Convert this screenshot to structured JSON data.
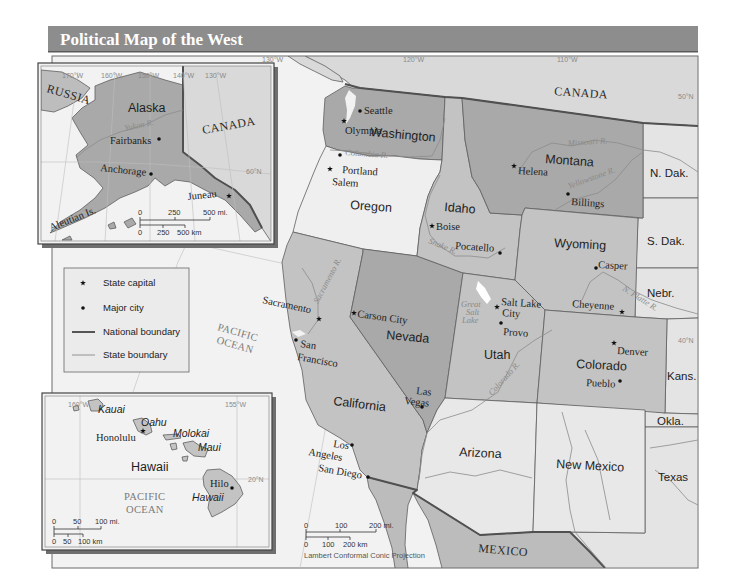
{
  "title": "Political Map of the West",
  "colors": {
    "title_bar": "#8d8d8d",
    "ocean": "#f2f2f2",
    "dark_state": "#a9a9a9",
    "medium_state": "#c3c3c3",
    "light_state": "#ececec",
    "other_state": "#e2e2e2",
    "foreign_land": "#d9d9d9"
  },
  "main_map": {
    "graticule": {
      "lon_130": "130°W",
      "lon_120": "120°W",
      "lon_110": "110°W",
      "lat_50": "50°N",
      "lat_40": "40°N"
    },
    "countries": {
      "canada": "CANADA",
      "mexico": "MEXICO"
    },
    "ocean": [
      "PACIFIC",
      "OCEAN"
    ],
    "states": {
      "washington": "Washington",
      "oregon": "Oregon",
      "california": "California",
      "nevada": "Nevada",
      "idaho": "Idaho",
      "montana": "Montana",
      "wyoming": "Wyoming",
      "utah": "Utah",
      "colorado": "Colorado",
      "arizona": "Arizona",
      "new_mexico": "New Mexico"
    },
    "neighbor_states": {
      "n_dak": "N. Dak.",
      "s_dak": "S. Dak.",
      "nebr": "Nebr.",
      "kans": "Kans.",
      "okla": "Okla.",
      "texas": "Texas"
    },
    "cities": {
      "seattle": {
        "name": "Seattle",
        "type": "major city"
      },
      "olympia": {
        "name": "Olympia",
        "type": "state capital"
      },
      "portland": {
        "name": "Portland",
        "type": "major city"
      },
      "salem": {
        "name": "Salem",
        "type": "state capital"
      },
      "boise": {
        "name": "Boise",
        "type": "state capital"
      },
      "pocatello": {
        "name": "Pocatello",
        "type": "major city"
      },
      "helena": {
        "name": "Helena",
        "type": "state capital"
      },
      "billings": {
        "name": "Billings",
        "type": "major city"
      },
      "casper": {
        "name": "Casper",
        "type": "major city"
      },
      "cheyenne": {
        "name": "Cheyenne",
        "type": "state capital"
      },
      "salt_lake_city": {
        "name_lines": [
          "Salt Lake",
          "City"
        ],
        "type": "state capital"
      },
      "provo": {
        "name": "Provo",
        "type": "major city"
      },
      "denver": {
        "name": "Denver",
        "type": "state capital"
      },
      "pueblo": {
        "name": "Pueblo",
        "type": "major city"
      },
      "sacramento": {
        "name": "Sacramento",
        "type": "state capital"
      },
      "san_francisco": {
        "name_lines": [
          "San",
          "Francisco"
        ],
        "type": "major city"
      },
      "carson_city": {
        "name": "Carson City",
        "type": "state capital"
      },
      "las_vegas": {
        "name_lines": [
          "Las",
          "Vegas"
        ],
        "type": "major city"
      },
      "los_angeles": {
        "name_lines": [
          "Los",
          "Angeles"
        ],
        "type": "major city"
      },
      "san_diego": {
        "name": "San Diego",
        "type": "major city"
      }
    },
    "rivers": {
      "columbia": "Columbia R.",
      "snake": "Snake R.",
      "missouri": "Missouri R.",
      "yellowstone": "Yellowstone R.",
      "n_platte": "N. Platte R.",
      "colorado": "Colorado R.",
      "sacramento": "Sacramento R."
    },
    "lakes": {
      "great_salt_lake": [
        "Great",
        "Salt",
        "Lake"
      ]
    },
    "scale": {
      "mi": [
        "0",
        "100",
        "200 mi."
      ],
      "km": [
        "0",
        "100",
        "200 km"
      ]
    },
    "projection": "Lambert Conformal Conic Projection"
  },
  "alaska_inset": {
    "state": "Alaska",
    "countries": {
      "russia": "RUSSIA",
      "canada": "CANADA"
    },
    "graticule": {
      "lon": [
        "170°W",
        "160°W",
        "150°W",
        "140°W",
        "130°W"
      ],
      "lat_60": "60°N"
    },
    "river": "Yukon R.",
    "islands": "Aleutian Is.",
    "cities": {
      "fairbanks": {
        "name": "Fairbanks",
        "type": "major city"
      },
      "anchorage": {
        "name": "Anchorage",
        "type": "major city"
      },
      "juneau": {
        "name": "Juneau",
        "type": "state capital"
      }
    },
    "scale": {
      "mi": [
        "0",
        "250",
        "500 mi."
      ],
      "km": [
        "0",
        "250",
        "500 km"
      ]
    }
  },
  "hawaii_inset": {
    "state": "Hawaii",
    "graticule": {
      "lon_160": "160°W",
      "lon_155": "155°W",
      "lat_20": "20°N"
    },
    "islands": {
      "kauai": "Kauai",
      "oahu": "Oahu",
      "molokai": "Molokai",
      "maui": "Maui",
      "hawaii": "Hawaii"
    },
    "cities": {
      "honolulu": {
        "name": "Honolulu",
        "type": "state capital"
      },
      "hilo": {
        "name": "Hilo",
        "type": "major city"
      }
    },
    "ocean": [
      "PACIFIC",
      "OCEAN"
    ],
    "scale": {
      "mi": [
        "0",
        "50",
        "100 mi."
      ],
      "km": [
        "0",
        "50",
        "100 km"
      ]
    }
  },
  "legend": {
    "items": [
      {
        "label": "State capital",
        "symbol": "star"
      },
      {
        "label": "Major city",
        "symbol": "dot"
      },
      {
        "label": "National boundary",
        "symbol": "thick-line"
      },
      {
        "label": "State boundary",
        "symbol": "thin-line"
      }
    ]
  }
}
